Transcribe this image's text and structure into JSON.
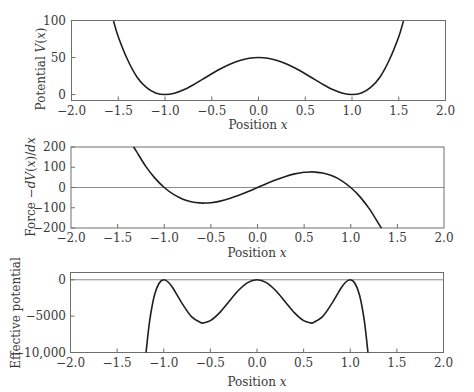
{
  "chart_data": [
    {
      "type": "line",
      "title": "",
      "xlabel": "Position x",
      "ylabel": "Potential V(x)",
      "xlim": [
        -2.0,
        2.0
      ],
      "ylim": [
        -8,
        100
      ],
      "xticks": [
        "-2.0",
        "-1.5",
        "-1.0",
        "-0.5",
        "0.0",
        "0.5",
        "1.0",
        "1.5",
        "2.0"
      ],
      "yticks": [
        "0",
        "50",
        "100"
      ],
      "zero_line": false,
      "series": [
        {
          "name": "V(x)",
          "x": [
            -1.55,
            -1.5,
            -1.4,
            -1.3,
            -1.2,
            -1.1,
            -1.0,
            -0.9,
            -0.8,
            -0.7,
            -0.6,
            -0.5,
            -0.4,
            -0.3,
            -0.2,
            -0.1,
            0.0,
            0.1,
            0.2,
            0.3,
            0.4,
            0.5,
            0.6,
            0.7,
            0.8,
            0.9,
            1.0,
            1.1,
            1.2,
            1.3,
            1.4,
            1.5,
            1.55
          ],
          "y": [
            99.2,
            78.1,
            47.0,
            23.8,
            9.7,
            2.2,
            0,
            1.8,
            6.5,
            13.0,
            20.5,
            28.1,
            35.3,
            41.4,
            46.1,
            49.0,
            50.0,
            49.0,
            46.1,
            41.4,
            35.3,
            28.1,
            20.5,
            13.0,
            6.5,
            1.8,
            0,
            2.2,
            9.7,
            23.8,
            47.0,
            78.1,
            99.2
          ]
        }
      ]
    },
    {
      "type": "line",
      "title": "",
      "xlabel": "Position x",
      "ylabel": "Force -dV(x)/dx",
      "xlim": [
        -2.0,
        2.0
      ],
      "ylim": [
        -200,
        200
      ],
      "xticks": [
        "-2.0",
        "-1.5",
        "-1.0",
        "-0.5",
        "0.0",
        "0.5",
        "1.0",
        "1.5",
        "2.0"
      ],
      "yticks": [
        "-200",
        "-100",
        "0",
        "100",
        "200"
      ],
      "zero_line": true,
      "series": [
        {
          "name": "F(x)",
          "x": [
            -1.33,
            -1.3,
            -1.2,
            -1.1,
            -1.0,
            -0.9,
            -0.8,
            -0.7,
            -0.6,
            -0.577,
            -0.5,
            -0.4,
            -0.3,
            -0.2,
            -0.1,
            0.0,
            0.1,
            0.2,
            0.3,
            0.4,
            0.5,
            0.577,
            0.6,
            0.7,
            0.8,
            0.9,
            1.0,
            1.1,
            1.2,
            1.3,
            1.33
          ],
          "y": [
            204.5,
            179.4,
            105.6,
            46.2,
            0,
            -34.2,
            -57.6,
            -71.4,
            -76.8,
            -77.0,
            -75.0,
            -67.2,
            -54.6,
            -38.4,
            -19.8,
            0,
            19.8,
            38.4,
            54.6,
            67.2,
            75.0,
            77.0,
            76.8,
            71.4,
            57.6,
            34.2,
            0,
            -46.2,
            -105.6,
            -179.4,
            -204.5
          ]
        }
      ]
    },
    {
      "type": "line",
      "title": "",
      "xlabel": "Position x",
      "ylabel": "Effective potential",
      "xlim": [
        -2.0,
        2.0
      ],
      "ylim": [
        -10000,
        1000
      ],
      "xticks": [
        "-2.0",
        "-1.5",
        "-1.0",
        "-0.5",
        "0.0",
        "0.5",
        "1.0",
        "1.5",
        "2.0"
      ],
      "yticks": [
        "-10,000",
        "-5000",
        "0"
      ],
      "zero_line": true,
      "series": [
        {
          "name": "Effective potential",
          "x": [
            -1.19,
            -1.15,
            -1.1,
            -1.05,
            -1.0,
            -0.95,
            -0.9,
            -0.8,
            -0.7,
            -0.6,
            -0.577,
            -0.5,
            -0.4,
            -0.3,
            -0.2,
            -0.1,
            0.0,
            0.1,
            0.2,
            0.3,
            0.4,
            0.5,
            0.577,
            0.6,
            0.7,
            0.8,
            0.9,
            0.95,
            1.0,
            1.05,
            1.1,
            1.15,
            1.19
          ],
          "y": [
            -10220,
            -5560,
            -2134,
            -474,
            0,
            -342,
            -1170,
            -3318,
            -5098,
            -5898,
            -5926,
            -5625,
            -4516,
            -2981,
            -1475,
            -392,
            0,
            -392,
            -1475,
            -2981,
            -4516,
            -5625,
            -5926,
            -5898,
            -5098,
            -3318,
            -1170,
            -342,
            0,
            -474,
            -2134,
            -5560,
            -10220
          ]
        }
      ]
    }
  ],
  "labels": {
    "xlabel_prefix": "Position ",
    "xlabel_var": "x",
    "top_ylabel_prefix": "Potential ",
    "top_ylabel_var": "V",
    "top_ylabel_paren_open": "(",
    "top_ylabel_x": "x",
    "top_ylabel_paren_close": ")",
    "mid_ylabel_prefix": "Force −",
    "mid_ylabel_expr": "dV",
    "mid_ylabel_paren": "(",
    "mid_ylabel_x": "x",
    "mid_ylabel_close": ")/",
    "mid_ylabel_dx": "dx",
    "bot_ylabel": "Effective potential"
  },
  "ticklabels": {
    "x": [
      "−2.0",
      "−1.5",
      "−1.0",
      "−0.5",
      "0.0",
      "0.5",
      "1.0",
      "1.5",
      "2.0"
    ],
    "top_y": [
      "100",
      "50",
      "0"
    ],
    "mid_y": [
      "200",
      "100",
      "0",
      "−100",
      "−200"
    ],
    "bot_y": [
      "0",
      "−5000",
      "−10,000"
    ]
  }
}
